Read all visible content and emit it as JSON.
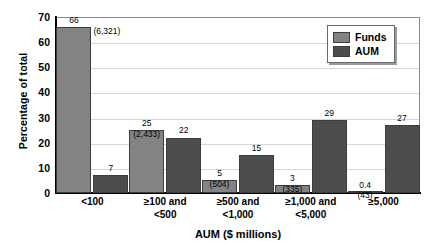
{
  "chart_data": {
    "type": "bar",
    "title": "",
    "xlabel": "AUM ($ millions)",
    "ylabel": "Percentage of total",
    "ylim": [
      0,
      70
    ],
    "ytick_step": 10,
    "yticks": [
      70,
      60,
      50,
      40,
      30,
      20,
      10,
      0
    ],
    "grid": true,
    "legend_position": "top-right",
    "categories": [
      "<100",
      "≥100 and\n<500",
      "≥500 and\n<1,000",
      "≥1,000 and\n<5,000",
      "≥5,000"
    ],
    "category_lines": [
      [
        "<100",
        ""
      ],
      [
        "≥100 and",
        "<500"
      ],
      [
        "≥500 and",
        "<1,000"
      ],
      [
        "≥1,000 and",
        "<5,000"
      ],
      [
        "≥5,000",
        ""
      ]
    ],
    "series": [
      {
        "name": "Funds",
        "color": "#838383",
        "values": [
          66,
          25,
          5,
          3,
          0.4
        ],
        "value_labels": [
          "66",
          "25",
          "5",
          "3",
          "0.4"
        ],
        "count_labels": [
          "(6,321)",
          "(2,433)",
          "(504)",
          "(335)",
          "(43)"
        ]
      },
      {
        "name": "AUM",
        "color": "#4d4d4d",
        "values": [
          7,
          22,
          15,
          29,
          27
        ],
        "value_labels": [
          "7",
          "22",
          "15",
          "29",
          "27"
        ],
        "count_labels": [
          "",
          "",
          "",
          "",
          ""
        ]
      }
    ]
  },
  "legend": {
    "items": [
      {
        "label": "Funds",
        "swatch": "funds"
      },
      {
        "label": "AUM",
        "swatch": "aum"
      }
    ]
  },
  "axes": {
    "y_title": "Percentage of total",
    "x_title": "AUM ($ millions)"
  },
  "colors": {
    "funds": "#838383",
    "aum": "#4d4d4d",
    "gridline": "#d6d6d6",
    "axis": "#000000",
    "background": "#ffffff"
  }
}
